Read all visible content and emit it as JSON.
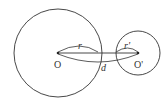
{
  "diagram": {
    "type": "two-circles",
    "circle_big": {
      "center_label": "O",
      "radius_label": "r",
      "cx": 58,
      "cy": 53,
      "r": 44
    },
    "circle_small": {
      "center_label": "O'",
      "radius_label": "r'",
      "cx": 138,
      "cy": 53,
      "r": 22
    },
    "distance_label": "d",
    "stroke_color": "#333333"
  }
}
